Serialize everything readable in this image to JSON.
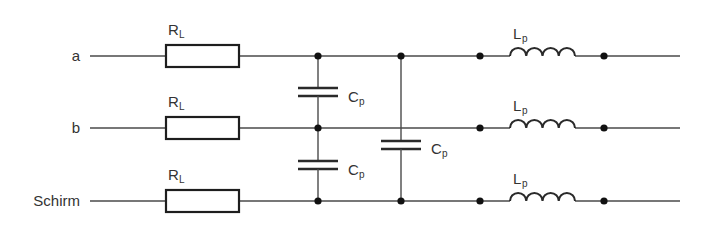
{
  "diagram": {
    "type": "circuit-schematic",
    "lines": [
      {
        "id": "a",
        "label": "a"
      },
      {
        "id": "b",
        "label": "b"
      },
      {
        "id": "schirm",
        "label": "Schirm"
      }
    ],
    "resistors": [
      {
        "symbol": "R",
        "subscript": "L",
        "line": "a"
      },
      {
        "symbol": "R",
        "subscript": "L",
        "line": "b"
      },
      {
        "symbol": "R",
        "subscript": "L",
        "line": "schirm"
      }
    ],
    "capacitors": [
      {
        "symbol": "C",
        "subscript": "p",
        "between": [
          "a",
          "b"
        ]
      },
      {
        "symbol": "C",
        "subscript": "p",
        "between": [
          "b",
          "schirm"
        ]
      },
      {
        "symbol": "C",
        "subscript": "p",
        "between": [
          "a",
          "schirm"
        ]
      }
    ],
    "inductors": [
      {
        "symbol": "L",
        "subscript": "p",
        "line": "a"
      },
      {
        "symbol": "L",
        "subscript": "p",
        "line": "b"
      },
      {
        "symbol": "L",
        "subscript": "p",
        "line": "schirm"
      }
    ]
  }
}
